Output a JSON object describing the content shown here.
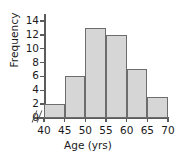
{
  "chart_data": {
    "type": "bar",
    "title": "",
    "subtitle": "",
    "xlabel": "Age (yrs)",
    "ylabel": "Frequency",
    "bin_edges": [
      40,
      45,
      50,
      55,
      60,
      65,
      70
    ],
    "categories": [
      "40-45",
      "45-50",
      "50-55",
      "55-60",
      "60-65",
      "65-70"
    ],
    "values": [
      2,
      6,
      13,
      12,
      7,
      3
    ],
    "xticks": [
      "40",
      "45",
      "50",
      "55",
      "60",
      "65",
      "70"
    ],
    "xtick_values": [
      40,
      45,
      50,
      55,
      60,
      65,
      70
    ],
    "yticks": [
      "0",
      "2",
      "4",
      "6",
      "8",
      "10",
      "12",
      "14"
    ],
    "ytick_values": [
      0,
      2,
      4,
      6,
      8,
      10,
      12,
      14
    ],
    "xlim": [
      40,
      70
    ],
    "ylim": [
      0,
      15
    ],
    "grid": false,
    "legend": null,
    "axis_break": "//",
    "bar_fill_color": "#d6d6d6",
    "bar_edge_color": "#6d6d6d",
    "axis_color": "#5b5b5b",
    "text_color": "#1a1a1a",
    "background_color": "#ffffff"
  }
}
